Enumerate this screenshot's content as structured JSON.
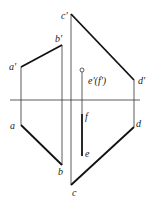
{
  "diagram": {
    "type": "orthographic-projection",
    "axis": {
      "name": "OX",
      "x1": 10,
      "x2": 140,
      "y": 100
    },
    "labels": {
      "a_prime": "a'",
      "b_prime": "b'",
      "c_prime": "c'",
      "d_prime": "d'",
      "ef_prime": "e'(f')",
      "a": "a",
      "b": "b",
      "c": "c",
      "d": "d",
      "e": "e",
      "f": "f"
    },
    "points": {
      "a_prime": [
        21,
        67
      ],
      "b_prime": [
        62,
        45
      ],
      "c_prime": [
        71,
        14
      ],
      "d_prime": [
        134,
        80
      ],
      "ef_prime": [
        82,
        70
      ],
      "a": [
        21,
        125
      ],
      "b": [
        62,
        165
      ],
      "c": [
        71,
        185
      ],
      "d": [
        134,
        127
      ],
      "f": [
        82,
        114
      ],
      "e": [
        82,
        156
      ]
    }
  }
}
